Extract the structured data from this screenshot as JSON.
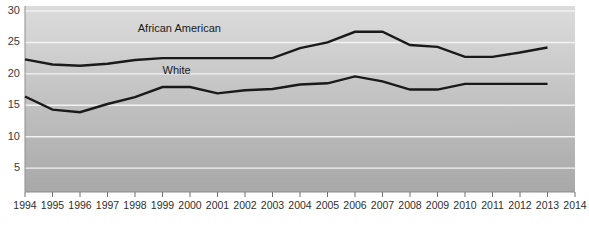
{
  "chart_data": {
    "type": "line",
    "title": "",
    "xlabel": "",
    "ylabel": "",
    "xlim": [
      1994,
      2014
    ],
    "ylim": [
      1.2,
      30.8
    ],
    "grid": true,
    "grid_axis": "y",
    "legend_position": "inline-annotations",
    "x": [
      1994,
      1995,
      1996,
      1997,
      1998,
      1999,
      2000,
      2001,
      2002,
      2003,
      2004,
      2005,
      2006,
      2007,
      2008,
      2009,
      2010,
      2011,
      2012,
      2013
    ],
    "xticks": [
      "1994",
      "1995",
      "1996",
      "1997",
      "1998",
      "1999",
      "2000",
      "2001",
      "2002",
      "2003",
      "2004",
      "2005",
      "2006",
      "2007",
      "2008",
      "2009",
      "2010",
      "2011",
      "2012",
      "2013",
      "2014"
    ],
    "xtick_values": [
      1994,
      1995,
      1996,
      1997,
      1998,
      1999,
      2000,
      2001,
      2002,
      2003,
      2004,
      2005,
      2006,
      2007,
      2008,
      2009,
      2010,
      2011,
      2012,
      2013,
      2014
    ],
    "yticks": [
      "5",
      "10",
      "15",
      "20",
      "25",
      "30"
    ],
    "ytick_values": [
      5,
      10,
      15,
      20,
      25,
      30
    ],
    "series": [
      {
        "name": "African American",
        "label_position": {
          "x": 1998.1,
          "y": 27.3
        },
        "color": "#1a1a1a",
        "values": [
          22.3,
          21.5,
          21.3,
          21.6,
          22.2,
          22.5,
          22.5,
          22.5,
          22.5,
          22.5,
          24.1,
          25.0,
          26.7,
          26.7,
          24.6,
          24.3,
          22.7,
          22.7,
          23.4,
          24.2
        ]
      },
      {
        "name": "White",
        "label_position": {
          "x": 1999.0,
          "y": 20.6
        },
        "color": "#1a1a1a",
        "values": [
          16.4,
          14.3,
          13.9,
          15.2,
          16.3,
          17.9,
          17.9,
          16.9,
          17.4,
          17.6,
          18.3,
          18.5,
          19.6,
          18.8,
          17.5,
          17.5,
          18.4,
          18.4,
          18.4,
          18.4
        ]
      }
    ],
    "style": {
      "plot_bg_top": "#dcdcdc",
      "plot_bg_bottom": "#a8a8a8",
      "gridline_color": "#f2f2f2",
      "axis_color": "#8d8d8d",
      "line_color": "#1a1a1a",
      "line_width": 2.4
    }
  }
}
